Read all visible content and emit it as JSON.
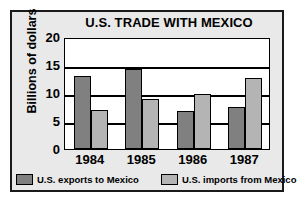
{
  "chart_data": {
    "type": "bar",
    "title": "U.S. TRADE WITH MEXICO",
    "xlabel": "",
    "ylabel": "Billions of dollars",
    "categories": [
      "1984",
      "1985",
      "1986",
      "1987"
    ],
    "series": [
      {
        "name": "U.S. exports to Mexico",
        "color": "#808080",
        "values": [
          13.0,
          14.3,
          6.7,
          7.5
        ]
      },
      {
        "name": "U.S. imports from Mexico",
        "color": "#b4b4b4",
        "values": [
          7.0,
          9.0,
          9.8,
          12.7
        ]
      }
    ],
    "ylim": [
      0,
      20
    ],
    "yticks": [
      0,
      5,
      10,
      15,
      20
    ],
    "ytick_labels": [
      "0",
      "5",
      "10",
      "15",
      "20"
    ],
    "grid": true,
    "legend_position": "bottom"
  },
  "legend": {
    "entries": [
      {
        "label": "U.S. exports to Mexico"
      },
      {
        "label": "U.S. imports from Mexico"
      }
    ]
  }
}
